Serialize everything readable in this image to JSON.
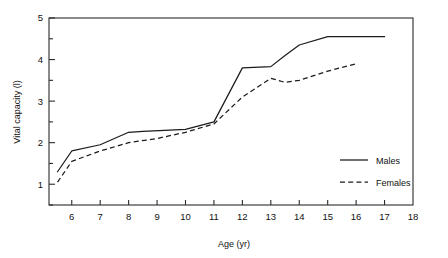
{
  "chart_data": {
    "type": "line",
    "title": "",
    "xlabel": "Age (yr)",
    "ylabel": "Vital capacity (l)",
    "xlim": [
      5.2,
      18
    ],
    "ylim": [
      0.5,
      5
    ],
    "grid": false,
    "legend_position": "inside-right",
    "x_ticks_major": [
      6,
      7,
      8,
      9,
      10,
      11,
      12,
      13,
      14,
      15,
      16,
      17,
      18
    ],
    "x_tick_labels": [
      "6",
      "7",
      "8",
      "9",
      "10",
      "11",
      "12",
      "13",
      "14",
      "15",
      "16",
      "17",
      "18"
    ],
    "y_ticks_major": [
      1,
      2,
      3,
      4,
      5
    ],
    "y_tick_labels": [
      "1",
      "2",
      "3",
      "4",
      "5"
    ],
    "y_ticks_minor": [
      0.5,
      1.5,
      2.5,
      3.5,
      4.5
    ],
    "series": [
      {
        "name": "Males",
        "style": "solid",
        "x": [
          5.5,
          6.0,
          7.0,
          8.0,
          8.5,
          10.0,
          11.0,
          12.0,
          13.0,
          13.5,
          14.0,
          15.0,
          17.0
        ],
        "values": [
          1.3,
          1.8,
          1.95,
          2.25,
          2.27,
          2.32,
          2.5,
          3.8,
          3.83,
          4.1,
          4.35,
          4.55,
          4.55
        ]
      },
      {
        "name": "Females",
        "style": "dashed",
        "x": [
          5.5,
          6.0,
          7.0,
          8.0,
          9.0,
          10.0,
          11.0,
          12.0,
          13.0,
          13.5,
          14.0,
          15.0,
          16.0
        ],
        "values": [
          1.05,
          1.55,
          1.8,
          2.0,
          2.1,
          2.25,
          2.45,
          3.1,
          3.55,
          3.45,
          3.5,
          3.72,
          3.9
        ]
      }
    ]
  },
  "legend": {
    "entries": [
      {
        "label": "Males",
        "style": "solid"
      },
      {
        "label": "Females",
        "style": "dashed"
      }
    ]
  },
  "axes": {
    "x_title": "Age (yr)",
    "y_title": "Vital capacity (l)"
  }
}
